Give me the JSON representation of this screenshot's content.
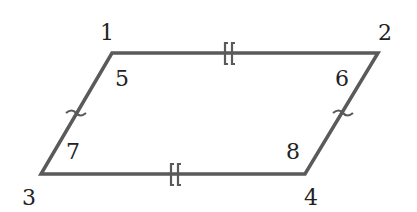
{
  "diagram": {
    "type": "parallelogram",
    "stroke_color": "#5a5a5a",
    "label_color": "#222222",
    "vertices": [
      {
        "label": "1",
        "x": 112,
        "y": 53
      },
      {
        "label": "2",
        "x": 378,
        "y": 53
      },
      {
        "label": "4",
        "x": 305,
        "y": 174
      },
      {
        "label": "3",
        "x": 41,
        "y": 174
      }
    ],
    "vertex_labels": {
      "v1": "1",
      "v2": "2",
      "v3": "3",
      "v4": "4"
    },
    "angle_labels": {
      "a5": "5",
      "a6": "6",
      "a7": "7",
      "a8": "8"
    },
    "congruence_marks": {
      "top_bottom": "double-bracket",
      "left_right": "single-curved-tick"
    }
  }
}
